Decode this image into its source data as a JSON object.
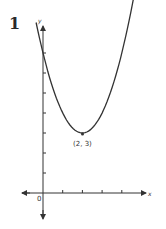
{
  "problem_number": "1",
  "chart_data": {
    "type": "line",
    "title": "",
    "xlabel": "x",
    "ylabel": "y",
    "origin_label": "0",
    "function": "y = (x - 2)^2 + 3",
    "x": [
      -0.3,
      0,
      1,
      2,
      3,
      4,
      4.8
    ],
    "values": [
      8.29,
      7,
      4,
      3,
      4,
      7,
      10.84
    ],
    "annotations": [
      {
        "x": 2,
        "y": 3,
        "text": "(2, 3)"
      }
    ],
    "x_ticks": [
      1,
      2,
      3,
      4
    ],
    "y_ticks": [
      1,
      2,
      3,
      4,
      5,
      6,
      7
    ],
    "xlim": [
      -1,
      5
    ],
    "ylim": [
      -1,
      8.5
    ],
    "grid": false,
    "legend": "none"
  }
}
